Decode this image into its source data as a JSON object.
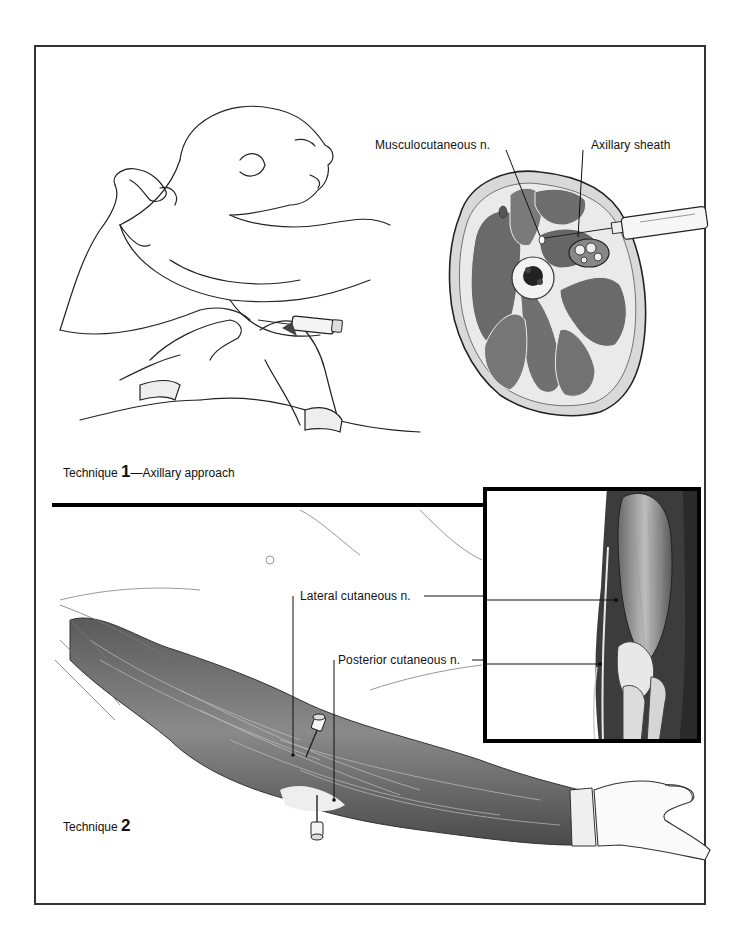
{
  "figure": {
    "technique1": {
      "caption_prefix": "Technique ",
      "caption_number": "1",
      "caption_suffix": "—Axillary approach",
      "labels": {
        "musculocutaneous": "Musculocutaneous n.",
        "axillary_sheath": "Axillary sheath"
      }
    },
    "technique2": {
      "caption_prefix": "Technique ",
      "caption_number": "2",
      "labels": {
        "lateral_cutaneous": "Lateral cutaneous n.",
        "posterior_cutaneous": "Posterior cutaneous n."
      }
    }
  },
  "colors": {
    "ink": "#111111",
    "muscle_dark": "#4a4a4a",
    "muscle_mid": "#7a7a7a",
    "muscle_light": "#b5b5b5",
    "frame": "#333333"
  }
}
